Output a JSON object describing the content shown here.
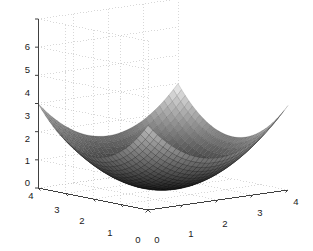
{
  "figure": {
    "background_color": "#ffffff",
    "type": "matlab-3d-surface-figure"
  },
  "chart_data": {
    "type": "surface",
    "title": "",
    "xlabel": "",
    "ylabel": "",
    "zlabel": "",
    "grid": true,
    "legend": false,
    "colormap": "gray",
    "surface_function": "z = 0.375*((x-2)^2 + (y-2)^2)",
    "xlim": [
      0,
      4
    ],
    "ylim": [
      0,
      4
    ],
    "zlim": [
      0,
      6
    ],
    "xticks": [
      0,
      1,
      2,
      3,
      4
    ],
    "yticks": [
      0,
      1,
      2,
      3,
      4
    ],
    "zticks": [
      0,
      1,
      2,
      3,
      4,
      5,
      6
    ],
    "xtick_labels": [
      "0",
      "1",
      "2",
      "3",
      "4"
    ],
    "ytick_labels": [
      "4",
      "3",
      "2",
      "1",
      "0"
    ],
    "ztick_labels": [
      "6",
      "5",
      "4",
      "3",
      "2",
      "1",
      "0"
    ],
    "x": [
      0,
      0.5,
      1,
      1.5,
      2,
      2.5,
      3,
      3.5,
      4
    ],
    "y": [
      0,
      0.5,
      1,
      1.5,
      2,
      2.5,
      3,
      3.5,
      4
    ],
    "z": [
      [
        3.0,
        2.34,
        1.88,
        1.59,
        1.5,
        1.59,
        1.88,
        2.34,
        3.0
      ],
      [
        2.34,
        1.69,
        1.22,
        0.94,
        0.84,
        0.94,
        1.22,
        1.69,
        2.34
      ],
      [
        1.88,
        1.22,
        0.75,
        0.47,
        0.38,
        0.47,
        0.75,
        1.22,
        1.88
      ],
      [
        1.59,
        0.94,
        0.47,
        0.19,
        0.09,
        0.19,
        0.47,
        0.94,
        1.59
      ],
      [
        1.5,
        0.84,
        0.38,
        0.09,
        0.0,
        0.09,
        0.38,
        0.84,
        1.5
      ],
      [
        1.59,
        0.94,
        0.47,
        0.19,
        0.09,
        0.19,
        0.47,
        0.94,
        1.59
      ],
      [
        1.88,
        1.22,
        0.75,
        0.47,
        0.38,
        0.47,
        0.75,
        1.22,
        1.88
      ],
      [
        2.34,
        1.69,
        1.22,
        0.94,
        0.84,
        0.94,
        1.22,
        1.69,
        2.34
      ],
      [
        3.0,
        2.34,
        1.88,
        1.59,
        1.5,
        1.59,
        1.88,
        2.34,
        3.0
      ]
    ],
    "view": {
      "azimuth": -37.5,
      "elevation": 30
    },
    "colors": {
      "axis_line": "#404040",
      "grid_line": "#c8c8c8",
      "tick_text": "#1a1a1a",
      "mesh_dark": "#1c1c1c",
      "mesh_mid": "#6e6e6e",
      "mesh_light": "#b5b5b5"
    }
  },
  "axes": {
    "z_ticks": [
      {
        "label": "6",
        "x": 30,
        "y": 50
      },
      {
        "label": "5",
        "x": 30,
        "y": 73
      },
      {
        "label": "4",
        "x": 30,
        "y": 96
      },
      {
        "label": "3",
        "x": 30,
        "y": 119
      },
      {
        "label": "2",
        "x": 30,
        "y": 142
      },
      {
        "label": "1",
        "x": 30,
        "y": 164
      },
      {
        "label": "0",
        "x": 30,
        "y": 186
      }
    ],
    "y_ticks": [
      {
        "label": "4",
        "x": 31,
        "y": 199
      },
      {
        "label": "3",
        "x": 57,
        "y": 213
      },
      {
        "label": "2",
        "x": 82,
        "y": 224
      },
      {
        "label": "1",
        "x": 110,
        "y": 236
      },
      {
        "label": "0",
        "x": 138,
        "y": 243
      }
    ],
    "x_ticks": [
      {
        "label": "0",
        "x": 157,
        "y": 243
      },
      {
        "label": "1",
        "x": 191,
        "y": 237
      },
      {
        "label": "2",
        "x": 225,
        "y": 227
      },
      {
        "label": "3",
        "x": 260,
        "y": 216
      },
      {
        "label": "4",
        "x": 296,
        "y": 205
      }
    ]
  }
}
